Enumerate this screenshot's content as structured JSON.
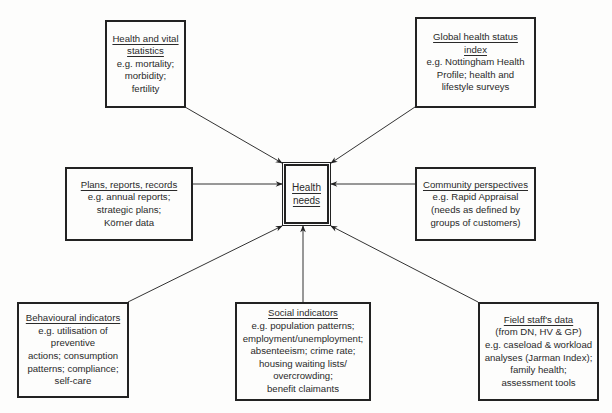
{
  "diagram": {
    "center": {
      "line1": "Health",
      "line2": "needs"
    },
    "nodes": [
      {
        "id": "health-vital",
        "title": "Health and vital\nstatistics",
        "title_l1": "Health and vital",
        "title_l2": "statistics",
        "body": "e.g. mortality;\nmorbidity;\nfertility"
      },
      {
        "id": "global-health",
        "title_l1": "Global health status",
        "title_l2": "index",
        "body": "e.g. Nottingham Health\nProfile; health and\nlifestyle surveys"
      },
      {
        "id": "plans",
        "title_l1": "Plans, reports, records",
        "body": "e.g. annual reports;\nstrategic plans;\nKörner data"
      },
      {
        "id": "community",
        "title_l1": "Community perspectives",
        "body": "e.g. Rapid Appraisal\n(needs as defined by\ngroups of customers)"
      },
      {
        "id": "behavioural",
        "title_l1": "Behavioural indicators",
        "body": "e.g. utilisation of\npreventive\nactions; consumption\npatterns; compliance;\nself-care"
      },
      {
        "id": "social",
        "title_l1": "Social indicators",
        "body": "e.g. population patterns;\nemployment/unemployment;\nabsenteeism; crime rate;\nhousing waiting lists/\novercrowding;\nbenefit claimants"
      },
      {
        "id": "field-staff",
        "title_l1": "Field staff's data",
        "body": "(from DN, HV & GP)\ne.g. caseload & workload\nanalyses (Jarman Index);\nfamily health;\nassessment tools"
      }
    ],
    "edges": [
      {
        "from": "health-vital",
        "to": "center"
      },
      {
        "from": "global-health",
        "to": "center"
      },
      {
        "from": "plans",
        "to": "center"
      },
      {
        "from": "community",
        "to": "center"
      },
      {
        "from": "behavioural",
        "to": "center"
      },
      {
        "from": "social",
        "to": "center"
      },
      {
        "from": "field-staff",
        "to": "center"
      }
    ]
  }
}
